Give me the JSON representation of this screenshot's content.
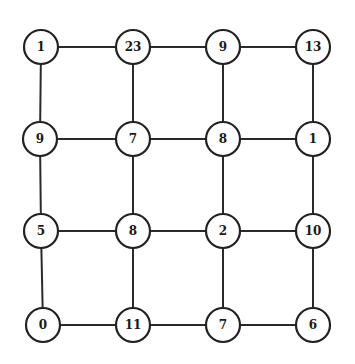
{
  "grid": {
    "rows": 4,
    "cols": 4,
    "labels": [
      [
        "1",
        "23",
        "9",
        "13"
      ],
      [
        "9",
        "7",
        "8",
        "1"
      ],
      [
        "5",
        "8",
        "2",
        "10"
      ],
      [
        "0",
        "11",
        "7",
        "6"
      ]
    ]
  },
  "colors": {
    "stroke": "#222222",
    "fill": "#ffffff",
    "text": "#1a1a1a"
  }
}
